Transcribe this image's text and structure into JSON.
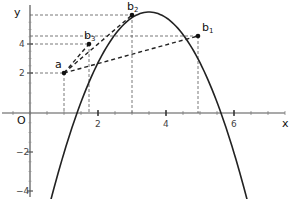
{
  "chart_data": {
    "type": "line",
    "title": "",
    "xlabel": "x",
    "ylabel": "y",
    "origin_label": "O",
    "xlim": [
      -0.8,
      7.8
    ],
    "ylim": [
      -4.3,
      5.8
    ],
    "x_ticks": [
      2,
      4,
      6
    ],
    "y_ticks": [
      -4,
      -2,
      2,
      4
    ],
    "grid": false,
    "curve": {
      "name": "parabola",
      "vertex_x": 3.5,
      "vertex_y": 5.8,
      "a": -0.62
    },
    "points": [
      {
        "name": "a",
        "sub": "",
        "x": 1,
        "y": 2
      },
      {
        "name": "b",
        "sub": "3",
        "x": 1.75,
        "y": 4
      },
      {
        "name": "b",
        "sub": "2",
        "x": 3,
        "y": 5.65
      },
      {
        "name": "b",
        "sub": "1",
        "x": 5,
        "y": 4.4
      }
    ],
    "secants": [
      [
        "a",
        "b3"
      ],
      [
        "a",
        "b2"
      ],
      [
        "a",
        "b1"
      ]
    ]
  }
}
